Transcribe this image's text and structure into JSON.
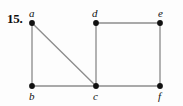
{
  "figure": {
    "number_label": "15.",
    "caption": "",
    "background_color": "#fdfdfd",
    "edge_color": "#8d8d8d",
    "vertex_color": "#111111",
    "label_color": "#111111"
  },
  "graph": {
    "vertices": [
      {
        "id": "a",
        "label": "a",
        "x": 32,
        "y": 23,
        "label_x": 29,
        "label_y": 8,
        "label_position": "above"
      },
      {
        "id": "b",
        "label": "b",
        "x": 32,
        "y": 86,
        "label_x": 29,
        "label_y": 91,
        "label_position": "below"
      },
      {
        "id": "c",
        "label": "c",
        "x": 96,
        "y": 86,
        "label_x": 93,
        "label_y": 91,
        "label_position": "below"
      },
      {
        "id": "d",
        "label": "d",
        "x": 96,
        "y": 23,
        "label_x": 92,
        "label_y": 8,
        "label_position": "above"
      },
      {
        "id": "e",
        "label": "e",
        "x": 160,
        "y": 23,
        "label_x": 158,
        "label_y": 8,
        "label_position": "above"
      },
      {
        "id": "f",
        "label": "f",
        "x": 160,
        "y": 86,
        "label_x": 158,
        "label_y": 91,
        "label_position": "below"
      }
    ],
    "edges": [
      {
        "from": "a",
        "to": "b",
        "x1": 32,
        "y1": 23,
        "x2": 32,
        "y2": 86
      },
      {
        "from": "a",
        "to": "c",
        "x1": 32,
        "y1": 23,
        "x2": 96,
        "y2": 86
      },
      {
        "from": "b",
        "to": "c",
        "x1": 32,
        "y1": 86,
        "x2": 96,
        "y2": 86
      },
      {
        "from": "c",
        "to": "d",
        "x1": 96,
        "y1": 86,
        "x2": 96,
        "y2": 23
      },
      {
        "from": "c",
        "to": "f",
        "x1": 96,
        "y1": 86,
        "x2": 160,
        "y2": 86
      },
      {
        "from": "d",
        "to": "e",
        "x1": 96,
        "y1": 23,
        "x2": 160,
        "y2": 23
      },
      {
        "from": "e",
        "to": "f",
        "x1": 160,
        "y1": 23,
        "x2": 160,
        "y2": 86
      }
    ],
    "vertex_radius": 2.9
  }
}
